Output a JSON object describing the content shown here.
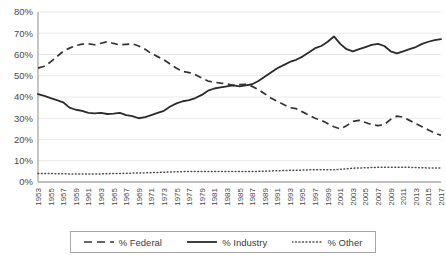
{
  "chart_data": {
    "type": "line",
    "title": "",
    "xlabel": "",
    "ylabel": "",
    "ylim": [
      0,
      80
    ],
    "ytick_labels": [
      "0%",
      "10%",
      "20%",
      "30%",
      "40%",
      "50%",
      "60%",
      "70%",
      "80%"
    ],
    "ytick_values": [
      0,
      10,
      20,
      30,
      40,
      50,
      60,
      70,
      80
    ],
    "grid": true,
    "legend_position": "bottom",
    "x": [
      1953,
      1954,
      1955,
      1956,
      1957,
      1958,
      1959,
      1960,
      1961,
      1962,
      1963,
      1964,
      1965,
      1966,
      1967,
      1968,
      1969,
      1970,
      1971,
      1972,
      1973,
      1974,
      1975,
      1976,
      1977,
      1978,
      1979,
      1980,
      1981,
      1982,
      1983,
      1984,
      1985,
      1986,
      1987,
      1988,
      1989,
      1990,
      1991,
      1992,
      1993,
      1994,
      1995,
      1996,
      1997,
      1998,
      1999,
      2000,
      2001,
      2002,
      2003,
      2004,
      2005,
      2006,
      2007,
      2008,
      2009,
      2010,
      2011,
      2012,
      2013,
      2014,
      2015,
      2016,
      2017
    ],
    "xtick_labels": [
      "1953",
      "1955",
      "1957",
      "1959",
      "1961",
      "1963",
      "1965",
      "1967",
      "1969",
      "1971",
      "1973",
      "1975",
      "1977",
      "1979",
      "1981",
      "1983",
      "1985",
      "1987",
      "1989",
      "1991",
      "1993",
      "1995",
      "1997",
      "1999",
      "2001",
      "2003",
      "2005",
      "2007",
      "2009",
      "2011",
      "2013",
      "2015",
      "2017"
    ],
    "series": [
      {
        "name": "% Federal",
        "style": "dashed",
        "color": "#333333",
        "values": [
          53.6,
          54.5,
          56.5,
          59.0,
          61.5,
          63.0,
          64.2,
          64.9,
          65.0,
          64.6,
          65.3,
          66.0,
          65.2,
          64.5,
          64.8,
          65.0,
          64.0,
          62.5,
          60.5,
          59.0,
          57.5,
          55.5,
          53.5,
          52.0,
          51.5,
          50.5,
          49.0,
          47.5,
          47.0,
          46.5,
          46.2,
          45.5,
          45.8,
          46.0,
          45.0,
          43.5,
          41.5,
          39.5,
          38.0,
          36.5,
          35.0,
          34.5,
          33.0,
          31.5,
          30.0,
          29.0,
          27.5,
          26.0,
          25.0,
          26.5,
          28.5,
          29.0,
          28.0,
          27.0,
          26.5,
          27.0,
          29.5,
          31.0,
          30.5,
          29.0,
          27.5,
          26.0,
          24.5,
          23.0,
          22.0
        ]
      },
      {
        "name": "% Industry",
        "style": "solid",
        "color": "#2b2b2b",
        "values": [
          41.4,
          40.5,
          39.5,
          38.5,
          37.5,
          35.0,
          34.0,
          33.5,
          32.5,
          32.3,
          32.5,
          32.0,
          32.2,
          32.5,
          31.5,
          31.0,
          30.0,
          30.5,
          31.5,
          32.5,
          33.5,
          35.5,
          37.0,
          38.0,
          38.5,
          39.5,
          41.0,
          43.0,
          44.0,
          44.5,
          45.0,
          45.5,
          45.0,
          45.5,
          46.0,
          47.5,
          49.5,
          51.5,
          53.5,
          55.0,
          56.5,
          57.5,
          59.0,
          61.0,
          63.0,
          64.0,
          66.0,
          68.5,
          65.0,
          62.5,
          61.5,
          62.5,
          63.5,
          64.5,
          65.0,
          64.0,
          61.5,
          60.5,
          61.5,
          62.5,
          63.5,
          65.0,
          66.0,
          66.8,
          67.2
        ]
      },
      {
        "name": "% Other",
        "style": "dotted",
        "color": "#4d4d4d",
        "values": [
          4.0,
          4.0,
          4.0,
          3.9,
          3.9,
          3.8,
          3.8,
          3.8,
          3.8,
          3.8,
          3.8,
          3.9,
          4.0,
          4.0,
          4.1,
          4.2,
          4.2,
          4.3,
          4.4,
          4.5,
          4.6,
          4.7,
          4.8,
          4.9,
          5.0,
          5.0,
          5.0,
          5.0,
          5.0,
          5.0,
          5.0,
          5.0,
          5.0,
          5.0,
          5.0,
          5.0,
          5.1,
          5.2,
          5.3,
          5.4,
          5.5,
          5.5,
          5.6,
          5.7,
          5.8,
          5.8,
          5.8,
          5.8,
          6.0,
          6.2,
          6.5,
          6.6,
          6.7,
          6.8,
          6.9,
          7.0,
          7.0,
          7.0,
          7.0,
          6.9,
          6.8,
          6.7,
          6.6,
          6.6,
          6.6
        ]
      }
    ]
  },
  "legend": {
    "entries": [
      {
        "label": "% Federal",
        "icon": "dashed-line-icon"
      },
      {
        "label": "% Industry",
        "icon": "solid-line-icon"
      },
      {
        "label": "% Other",
        "icon": "dotted-line-icon"
      }
    ]
  }
}
